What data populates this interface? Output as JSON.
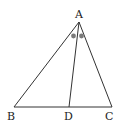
{
  "diagram": {
    "type": "triangle-with-angle-bisector",
    "points": {
      "A": {
        "label": "A",
        "x": 79,
        "y": 22
      },
      "B": {
        "label": "B",
        "x": 14,
        "y": 107
      },
      "C": {
        "label": "C",
        "x": 112,
        "y": 107
      },
      "D": {
        "label": "D",
        "x": 69,
        "y": 107
      }
    },
    "segments": [
      "AB",
      "AC",
      "BC",
      "AD"
    ],
    "angle_marks": {
      "description": "equal angle marks at A (BAD = DAC)",
      "color": "#7a7a7a"
    },
    "stroke_color": "#333333"
  }
}
